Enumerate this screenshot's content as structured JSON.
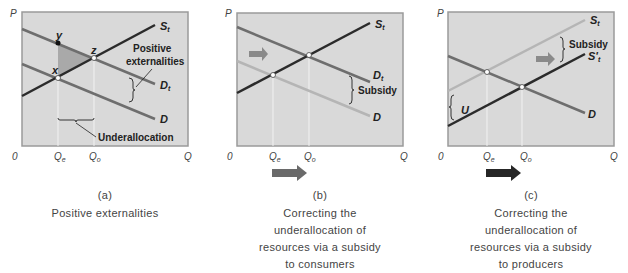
{
  "panels": [
    {
      "id": "a",
      "letter": "(a)",
      "caption": [
        "Positive externalities"
      ],
      "axes": {
        "y": "P",
        "x": "Q",
        "origin": "0",
        "ticks": [
          {
            "label": "Q",
            "sub": "e"
          },
          {
            "label": "Q",
            "sub": "o"
          }
        ]
      },
      "curves": [
        {
          "label": "S",
          "sub": "t"
        },
        {
          "label": "D",
          "sub": "t"
        },
        {
          "label": "D",
          "sub": ""
        }
      ],
      "points": [
        "x",
        "y",
        "z"
      ],
      "annotations": {
        "externalities_line1": "Positive",
        "externalities_line2": "externalities",
        "underallocation": "Underallocation"
      }
    },
    {
      "id": "b",
      "letter": "(b)",
      "caption": [
        "Correcting the",
        "underallocation of",
        "resources via a subsidy",
        "to consumers"
      ],
      "axes": {
        "y": "P",
        "x": "Q",
        "origin": "0",
        "ticks": [
          {
            "label": "Q",
            "sub": "e"
          },
          {
            "label": "Q",
            "sub": "o"
          }
        ]
      },
      "curves": [
        {
          "label": "S",
          "sub": "t"
        },
        {
          "label": "D",
          "sub": "t"
        },
        {
          "label": "D",
          "sub": ""
        }
      ],
      "annotations": {
        "subsidy": "Subsidy"
      }
    },
    {
      "id": "c",
      "letter": "(c)",
      "caption": [
        "Correcting the",
        "underallocation of",
        "resources via a subsidy",
        "to producers"
      ],
      "axes": {
        "y": "P",
        "x": "Q",
        "origin": "0",
        "ticks": [
          {
            "label": "Q",
            "sub": "e"
          },
          {
            "label": "Q",
            "sub": "o"
          }
        ]
      },
      "curves": [
        {
          "label": "S",
          "sub": "t"
        },
        {
          "label": "S'",
          "sub": "t"
        },
        {
          "label": "D",
          "sub": ""
        }
      ],
      "annotations": {
        "subsidy": "Subsidy",
        "u": "U"
      }
    }
  ],
  "colors": {
    "plot_bg": "#d9d9d9",
    "plot_border": "#9a9a9a",
    "supply": "#2b2b2b",
    "demand": "#6e6e6e",
    "light_curve": "#b5b5b5",
    "arrow_b": "#6a6a6a",
    "arrow_c": "#262626"
  }
}
